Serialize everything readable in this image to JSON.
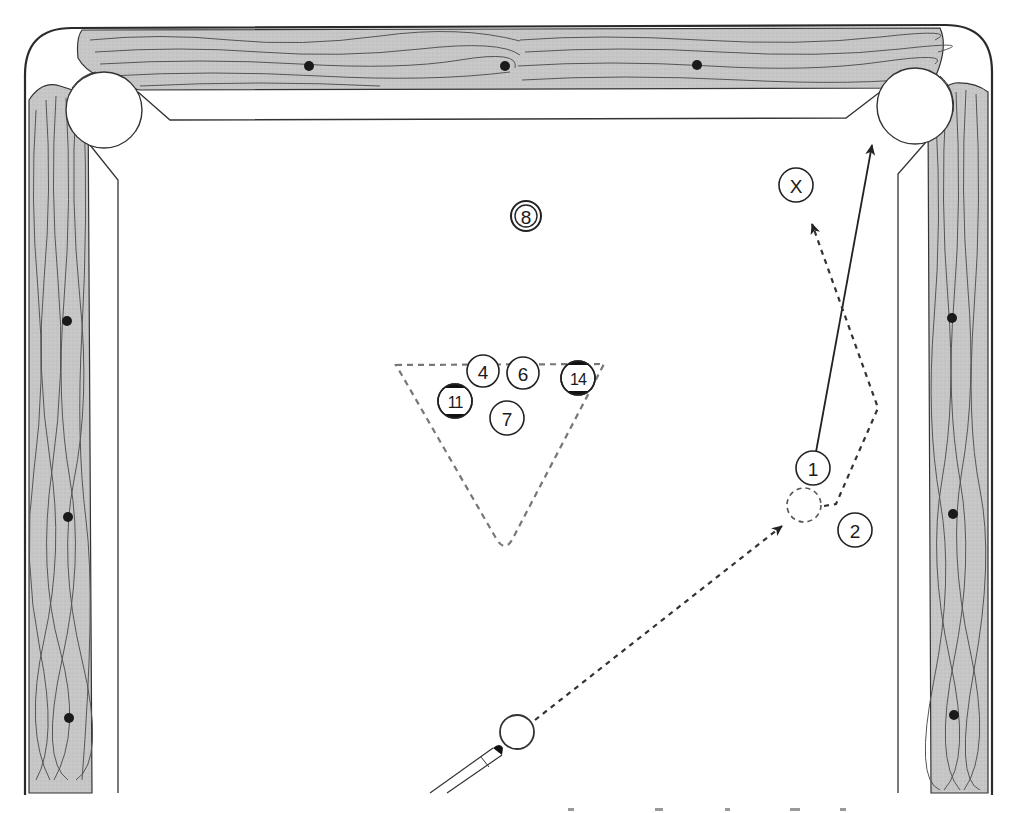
{
  "diagram": {
    "colors": {
      "felt": "#ffffff",
      "rail_wood": "#c4c4c4",
      "outline": "#333333",
      "grain": "#555555",
      "diamond": "#1a1a1a",
      "path": "#333333",
      "rack": "#777777"
    },
    "table": {
      "pockets": [
        "top-left-corner-pocket",
        "top-right-corner-pocket"
      ],
      "diamonds": {
        "top_rail": 3,
        "left_rail": 3,
        "right_rail": 3
      }
    },
    "balls": [
      {
        "id": "8",
        "label": "8",
        "style": "eight-ball"
      },
      {
        "id": "4",
        "label": "4",
        "style": "solid"
      },
      {
        "id": "6",
        "label": "6",
        "style": "solid"
      },
      {
        "id": "14",
        "label": "14",
        "style": "stripe"
      },
      {
        "id": "11",
        "label": "11",
        "style": "stripe"
      },
      {
        "id": "7",
        "label": "7",
        "style": "solid"
      },
      {
        "id": "1",
        "label": "1",
        "style": "solid"
      },
      {
        "id": "2",
        "label": "2",
        "style": "solid"
      },
      {
        "id": "X",
        "label": "X",
        "style": "target-marker"
      },
      {
        "id": "cue",
        "label": "",
        "style": "cue-ball"
      }
    ],
    "paths": [
      {
        "name": "cue-ball-path",
        "from": "cue",
        "to": "ghost-ball",
        "style": "dashed-arrow"
      },
      {
        "name": "object-ball-path",
        "from": "1",
        "to": "top-right-corner-pocket",
        "style": "solid-arrow"
      },
      {
        "name": "cue-ball-after-contact-path",
        "from": "ghost-ball",
        "to": "X",
        "style": "dashed-arrow",
        "via": "right-side-bounce"
      }
    ],
    "rack_outline": {
      "shape": "triangle",
      "style": "dashed"
    }
  }
}
